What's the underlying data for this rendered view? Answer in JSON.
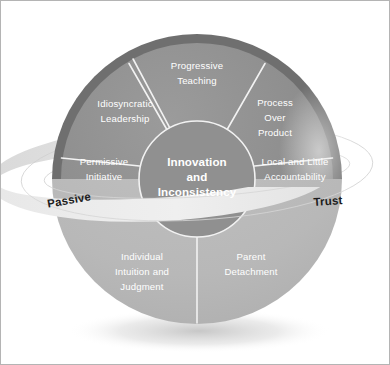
{
  "diagram": {
    "type": "sphere-segment-diagram",
    "core": {
      "lines": [
        "Innovation",
        "and",
        "Inconsistency"
      ]
    },
    "segments": [
      {
        "id": "progressive-teaching",
        "position": "top",
        "lines": [
          "Progressive",
          "Teaching"
        ]
      },
      {
        "id": "idiosyncratic-leadership",
        "position": "upper-left",
        "lines": [
          "Idiosyncratic",
          "Leadership"
        ]
      },
      {
        "id": "process-over-product",
        "position": "upper-right",
        "lines": [
          "Process",
          "Over",
          "Product"
        ]
      },
      {
        "id": "permissive-initiative",
        "position": "left",
        "lines": [
          "Permissive",
          "Initiative"
        ]
      },
      {
        "id": "local-and-little-accountability",
        "position": "right",
        "lines": [
          "Local and Little",
          "Accountability"
        ]
      },
      {
        "id": "individual-intuition-and-judgment",
        "position": "bottom-left",
        "lines": [
          "Individual",
          "Intuition and",
          "Judgment"
        ]
      },
      {
        "id": "parent-detachment",
        "position": "bottom-right",
        "lines": [
          "Parent",
          "Detachment"
        ]
      }
    ],
    "ring": {
      "left_label": "Passive",
      "right_label": "Trust"
    },
    "colors": {
      "upper_hemisphere": "#8f8f8f",
      "upper_rim": "#6e6e6e",
      "lower_hemisphere": "#b9b9b9",
      "core_fill": "#909090",
      "ring_fill": "#dcdcdc",
      "ring_front": "#e4e4e4",
      "divider": "#ffffff",
      "frame_border": "#b4b4b4",
      "label_text": "#ffffff",
      "ring_text": "#1c1c1c",
      "background": "#ffffff"
    }
  }
}
